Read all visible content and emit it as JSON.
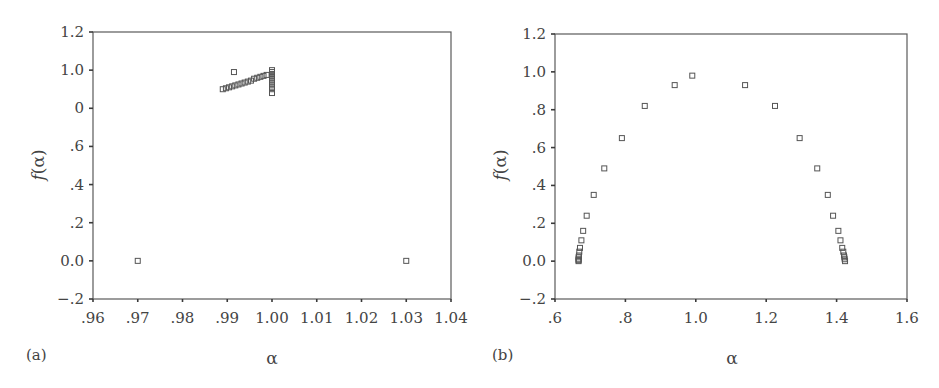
{
  "chart_data": [
    {
      "panel_label": "(a)",
      "type": "scatter",
      "title": "",
      "xlabel": "α",
      "ylabel": "f(α)",
      "xlim": [
        0.96,
        1.04
      ],
      "ylim": [
        -0.2,
        1.2
      ],
      "x_ticks": [
        0.96,
        0.97,
        0.98,
        0.99,
        1.0,
        1.01,
        1.02,
        1.03,
        1.04
      ],
      "x_tick_labels": [
        ".96",
        ".97",
        ".98",
        ".99",
        "1.00",
        "1.01",
        "1.02",
        "1.03",
        "1.04"
      ],
      "y_ticks": [
        1.2,
        1.0,
        0.8,
        0.6,
        0.4,
        0.2,
        0.0,
        -0.2
      ],
      "y_tick_labels": [
        "1.2",
        "1.0",
        "0",
        ".6",
        ".4",
        ".2",
        "0.0",
        "−.2"
      ],
      "grid": false,
      "marker": "open-square",
      "points": [
        {
          "x": 0.97,
          "y": 0.0
        },
        {
          "x": 1.03,
          "y": 0.0
        },
        {
          "x": 0.9915,
          "y": 0.99
        },
        {
          "x": 0.989,
          "y": 0.9
        },
        {
          "x": 0.9897,
          "y": 0.905
        },
        {
          "x": 0.9904,
          "y": 0.91
        },
        {
          "x": 0.9911,
          "y": 0.915
        },
        {
          "x": 0.9918,
          "y": 0.92
        },
        {
          "x": 0.9925,
          "y": 0.925
        },
        {
          "x": 0.9932,
          "y": 0.93
        },
        {
          "x": 0.9939,
          "y": 0.935
        },
        {
          "x": 0.9946,
          "y": 0.94
        },
        {
          "x": 0.9953,
          "y": 0.945
        },
        {
          "x": 0.996,
          "y": 0.955
        },
        {
          "x": 0.9967,
          "y": 0.96
        },
        {
          "x": 0.9974,
          "y": 0.965
        },
        {
          "x": 0.9981,
          "y": 0.97
        },
        {
          "x": 0.9988,
          "y": 0.975
        },
        {
          "x": 1.0,
          "y": 1.0
        },
        {
          "x": 1.0,
          "y": 0.99
        },
        {
          "x": 1.0,
          "y": 0.98
        },
        {
          "x": 1.0,
          "y": 0.97
        },
        {
          "x": 1.0,
          "y": 0.96
        },
        {
          "x": 1.0,
          "y": 0.95
        },
        {
          "x": 1.0,
          "y": 0.94
        },
        {
          "x": 1.0,
          "y": 0.93
        },
        {
          "x": 1.0,
          "y": 0.92
        },
        {
          "x": 1.0,
          "y": 0.91
        },
        {
          "x": 1.0,
          "y": 0.9
        },
        {
          "x": 1.0,
          "y": 0.88
        }
      ]
    },
    {
      "panel_label": "(b)",
      "type": "scatter",
      "title": "",
      "xlabel": "α",
      "ylabel": "f(α)",
      "xlim": [
        0.6,
        1.6
      ],
      "ylim": [
        -0.2,
        1.2
      ],
      "x_ticks": [
        0.6,
        0.8,
        1.0,
        1.2,
        1.4,
        1.6
      ],
      "x_tick_labels": [
        ".6",
        ".8",
        "1.0",
        "1.2",
        "1.4",
        "1.6"
      ],
      "y_ticks": [
        1.2,
        1.0,
        0.8,
        0.6,
        0.4,
        0.2,
        0.0,
        -0.2
      ],
      "y_tick_labels": [
        "1.2",
        "1.0",
        ".8",
        ".6",
        ".4",
        ".2",
        "0.0",
        "−.2"
      ],
      "grid": false,
      "marker": "open-square",
      "points": [
        {
          "x": 0.667,
          "y": 0.0
        },
        {
          "x": 0.667,
          "y": 0.005
        },
        {
          "x": 0.667,
          "y": 0.01
        },
        {
          "x": 0.667,
          "y": 0.02
        },
        {
          "x": 0.668,
          "y": 0.03
        },
        {
          "x": 0.669,
          "y": 0.05
        },
        {
          "x": 0.671,
          "y": 0.07
        },
        {
          "x": 0.675,
          "y": 0.11
        },
        {
          "x": 0.68,
          "y": 0.16
        },
        {
          "x": 0.69,
          "y": 0.24
        },
        {
          "x": 0.71,
          "y": 0.35
        },
        {
          "x": 0.74,
          "y": 0.49
        },
        {
          "x": 0.79,
          "y": 0.65
        },
        {
          "x": 0.855,
          "y": 0.82
        },
        {
          "x": 0.94,
          "y": 0.93
        },
        {
          "x": 0.99,
          "y": 0.98
        },
        {
          "x": 1.14,
          "y": 0.93
        },
        {
          "x": 1.225,
          "y": 0.82
        },
        {
          "x": 1.295,
          "y": 0.65
        },
        {
          "x": 1.345,
          "y": 0.49
        },
        {
          "x": 1.375,
          "y": 0.35
        },
        {
          "x": 1.39,
          "y": 0.24
        },
        {
          "x": 1.405,
          "y": 0.16
        },
        {
          "x": 1.411,
          "y": 0.11
        },
        {
          "x": 1.416,
          "y": 0.07
        },
        {
          "x": 1.419,
          "y": 0.05
        },
        {
          "x": 1.421,
          "y": 0.03
        },
        {
          "x": 1.422,
          "y": 0.02
        },
        {
          "x": 1.423,
          "y": 0.01
        },
        {
          "x": 1.424,
          "y": 0.0
        }
      ]
    }
  ],
  "panels": {
    "a": {
      "label": "(a)",
      "xlabel": "α",
      "ylabel_f": "f",
      "ylabel_arg": "(α)"
    },
    "b": {
      "label": "(b)",
      "xlabel": "α",
      "ylabel_f": "f",
      "ylabel_arg": "(α)"
    }
  }
}
